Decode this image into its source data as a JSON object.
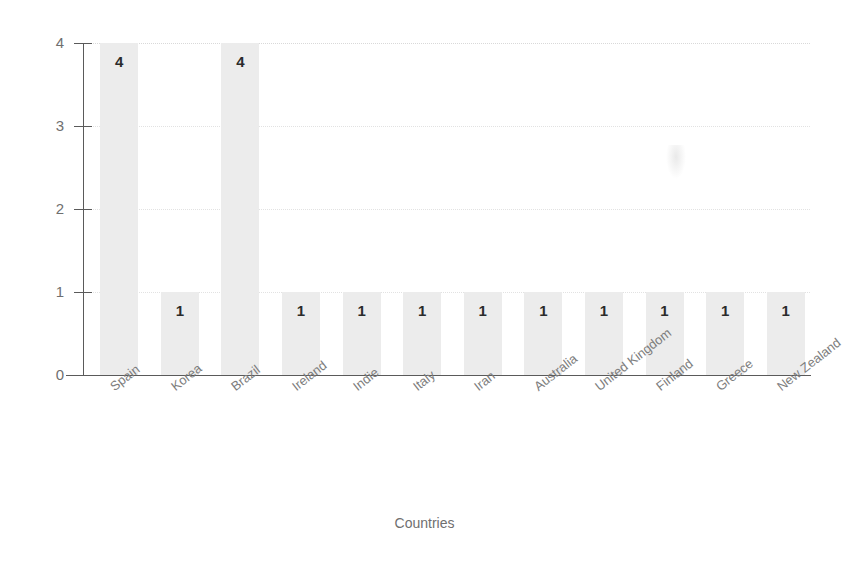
{
  "chart_data": {
    "type": "bar",
    "title": "",
    "xlabel": "Countries",
    "ylabel": "",
    "ylim": [
      0,
      4
    ],
    "yticks": [
      "0",
      "1",
      "2",
      "3",
      "4"
    ],
    "grid": true,
    "legend": "none",
    "orientation": "vertical",
    "bar_color": "#ececec",
    "label_color": "#2b2b2b",
    "axis_color": "#5a5a5a",
    "tick_label_color": "#7d7d7d",
    "categories": [
      "Spain",
      "Korea",
      "Brazil",
      "Ireland",
      "Indie",
      "Italy",
      "Iran",
      "Australia",
      "United Kingdom",
      "Finland",
      "Greece",
      "New Zealand"
    ],
    "values": [
      4,
      1,
      4,
      1,
      1,
      1,
      1,
      1,
      1,
      1,
      1,
      1
    ],
    "data_labels": [
      "4",
      "1",
      "4",
      "1",
      "1",
      "1",
      "1",
      "1",
      "1",
      "1",
      "1",
      "1"
    ]
  }
}
